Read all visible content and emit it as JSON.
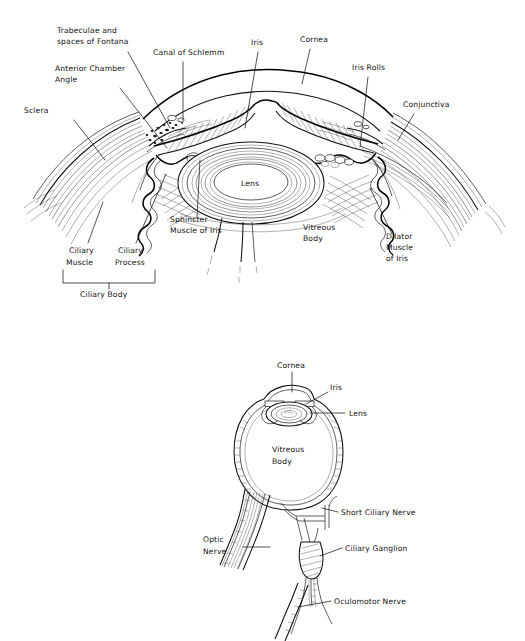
{
  "figure": {
    "background_color": "#ffffff",
    "ink_color": "#111111",
    "width": 525,
    "height": 641
  },
  "top_diagram": {
    "name": "Anterior segment of the eye (sectional view)",
    "labels": [
      {
        "id": "trabeculae",
        "text_lines": [
          "Trabeculae and",
          "spaces of Fontana"
        ],
        "x": 57,
        "y": 33,
        "anchor": "start"
      },
      {
        "id": "canal_of_schlemm",
        "text_lines": [
          "Canal of Schlemm"
        ],
        "x": 153,
        "y": 55,
        "anchor": "start"
      },
      {
        "id": "iris",
        "text_lines": [
          "Iris"
        ],
        "x": 251,
        "y": 45,
        "anchor": "start"
      },
      {
        "id": "cornea",
        "text_lines": [
          "Cornea"
        ],
        "x": 300,
        "y": 42,
        "anchor": "start"
      },
      {
        "id": "iris_rolls",
        "text_lines": [
          "Iris Rolls"
        ],
        "x": 352,
        "y": 70,
        "anchor": "start"
      },
      {
        "id": "conjunctiva",
        "text_lines": [
          "Conjunctiva"
        ],
        "x": 403,
        "y": 107,
        "anchor": "start"
      },
      {
        "id": "anterior_chamber",
        "text_lines": [
          "Anterior Chamber",
          "Angle"
        ],
        "x": 55,
        "y": 71,
        "anchor": "start"
      },
      {
        "id": "sclera",
        "text_lines": [
          "Sclera"
        ],
        "x": 24,
        "y": 113,
        "anchor": "start"
      },
      {
        "id": "sphincter",
        "text_lines": [
          "Sphincter",
          "Muscle of Iris"
        ],
        "x": 170,
        "y": 222,
        "anchor": "start"
      },
      {
        "id": "vitreous_body",
        "text_lines": [
          "Vitreous",
          "Body"
        ],
        "x": 303,
        "y": 230,
        "anchor": "start"
      },
      {
        "id": "dilator",
        "text_lines": [
          "Dilator",
          "Muscle",
          "of Iris"
        ],
        "x": 386,
        "y": 239,
        "anchor": "start"
      },
      {
        "id": "ciliary_muscle",
        "text_lines": [
          "Ciliary",
          "Muscle"
        ],
        "x": 69,
        "y": 253,
        "anchor": "start"
      },
      {
        "id": "ciliary_process",
        "text_lines": [
          "Ciliary",
          "Process"
        ],
        "x": 118,
        "y": 253,
        "anchor": "start"
      },
      {
        "id": "ciliary_body",
        "text_lines": [
          "Ciliary Body"
        ],
        "x": 80,
        "y": 294,
        "anchor": "start"
      },
      {
        "id": "lens",
        "text_lines": [
          "Lens"
        ],
        "x": 250,
        "y": 182,
        "anchor": "middle"
      }
    ]
  },
  "bottom_diagram": {
    "name": "Whole eyeball with optic nerve, ciliary ganglion and oculomotor nerve",
    "labels": [
      {
        "id": "cornea_b",
        "text_lines": [
          "Cornea"
        ],
        "x": 277,
        "y": 368,
        "anchor": "start"
      },
      {
        "id": "iris_b",
        "text_lines": [
          "Iris"
        ],
        "x": 330,
        "y": 390,
        "anchor": "start"
      },
      {
        "id": "lens_b",
        "text_lines": [
          "Lens"
        ],
        "x": 347,
        "y": 416,
        "anchor": "start"
      },
      {
        "id": "vitreous_body_b",
        "text_lines": [
          "Vitreous",
          "Body"
        ],
        "x": 272,
        "y": 452,
        "anchor": "start"
      },
      {
        "id": "short_ciliary",
        "text_lines": [
          "Short Ciliary Nerve"
        ],
        "x": 340,
        "y": 515,
        "anchor": "start"
      },
      {
        "id": "ciliary_ganglion",
        "text_lines": [
          "Ciliary Ganglion"
        ],
        "x": 344,
        "y": 551,
        "anchor": "start"
      },
      {
        "id": "optic_nerve",
        "text_lines": [
          "Optic",
          "Nerve"
        ],
        "x": 203,
        "y": 542,
        "anchor": "start"
      },
      {
        "id": "oculomotor_nerve",
        "text_lines": [
          "Oculomotor Nerve"
        ],
        "x": 333,
        "y": 604,
        "anchor": "start"
      }
    ]
  }
}
